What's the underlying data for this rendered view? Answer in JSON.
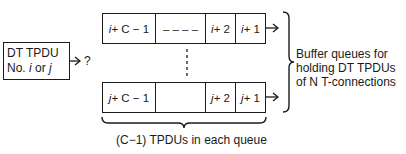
{
  "source": {
    "line1": "DT TPDU",
    "line2_prefix": "No. ",
    "line2_i": "i",
    "line2_mid": " or ",
    "line2_j": "j",
    "question": "?"
  },
  "queues": [
    {
      "name": "queue-i",
      "cells": [
        {
          "var": "i",
          "suffix": " + C − 1"
        },
        {
          "var": "",
          "suffix": "– – – –"
        },
        {
          "var": "i",
          "suffix": " + 2"
        },
        {
          "var": "i",
          "suffix": " + 1"
        }
      ]
    },
    {
      "name": "queue-j",
      "cells": [
        {
          "var": "j",
          "suffix": " + C − 1"
        },
        {
          "var": "",
          "suffix": ""
        },
        {
          "var": "j",
          "suffix": " + 2"
        },
        {
          "var": "j",
          "suffix": " + 1"
        }
      ]
    }
  ],
  "right_label": {
    "line1": "Buffer queues for",
    "line2": "holding DT TPDUs",
    "line3": "of N T-connections"
  },
  "bottom_label": "(C−1) TPDUs in each queue"
}
